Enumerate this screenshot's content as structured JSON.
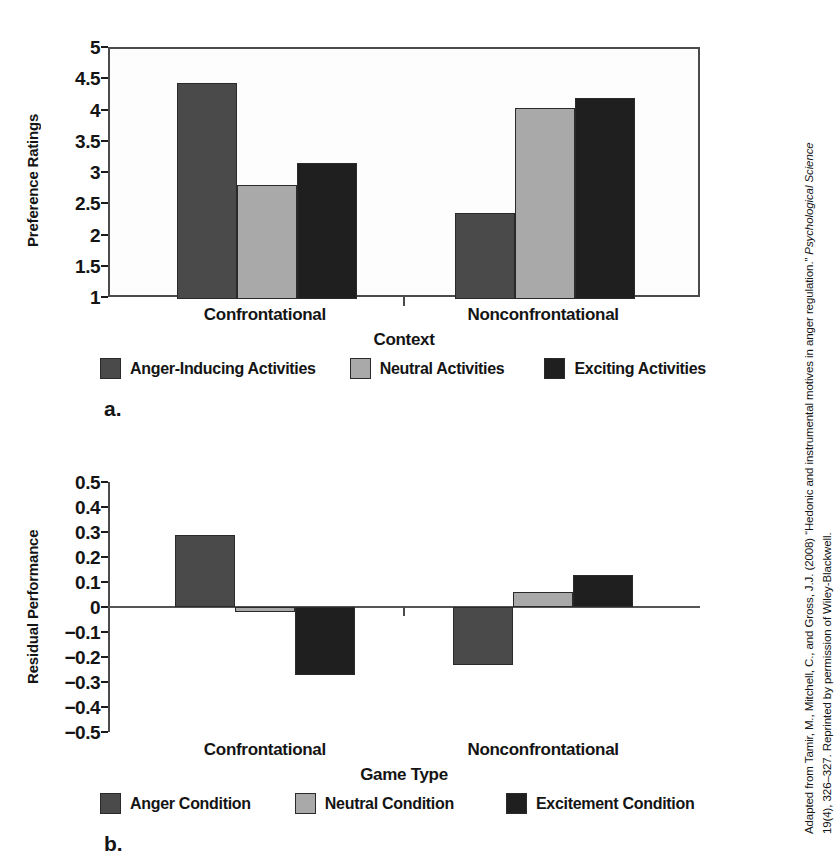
{
  "figure": {
    "panel_a_letter": "a.",
    "panel_b_letter": "b."
  },
  "credit": {
    "line1_pre": "Adapted from Tamir, M., Mitchell, C., and Gross, J.J. (2008) “Hedonic and instrumental motives in anger regulation.” ",
    "line1_italic": "Psychological Science",
    "line2": "19(4), 326–327. Reprinted by permission of Wiley-Blackwell."
  },
  "colors": {
    "series1": "#4a4a4a",
    "series2": "#a9a9a9",
    "series3": "#1f1f1f",
    "axis": "#4b4b4b",
    "text": "#141414"
  },
  "chart_data": [
    {
      "type": "bar",
      "panel": "a",
      "title": "",
      "xlabel": "Context",
      "ylabel": "Preference Ratings",
      "categories": [
        "Confrontational",
        "Nonconfrontational"
      ],
      "ylim": [
        1,
        5
      ],
      "yticks": [
        "1",
        "1.5",
        "2",
        "2.5",
        "3",
        "3.5",
        "4",
        "4.5",
        "5"
      ],
      "ytick_values": [
        1,
        1.5,
        2,
        2.5,
        3,
        3.5,
        4,
        4.5,
        5
      ],
      "grid": false,
      "legend_position": "bottom",
      "series": [
        {
          "name": "Anger-Inducing Activities",
          "color": "#4a4a4a",
          "values": [
            4.46,
            2.37
          ]
        },
        {
          "name": "Neutral Activities",
          "color": "#a9a9a9",
          "values": [
            2.83,
            4.06
          ]
        },
        {
          "name": "Exciting Activities",
          "color": "#1f1f1f",
          "values": [
            3.17,
            4.22
          ]
        }
      ]
    },
    {
      "type": "bar",
      "panel": "b",
      "title": "",
      "xlabel": "Game Type",
      "ylabel": "Residual Performance",
      "categories": [
        "Confrontational",
        "Nonconfrontational"
      ],
      "ylim": [
        -0.5,
        0.5
      ],
      "yticks": [
        "0.5",
        "0.4",
        "0.3",
        "0.2",
        "0.1",
        "0",
        "−0.1",
        "−0.2",
        "−0.3",
        "−0.4",
        "−0.5"
      ],
      "ytick_values": [
        0.5,
        0.4,
        0.3,
        0.2,
        0.1,
        0,
        -0.1,
        -0.2,
        -0.3,
        -0.4,
        -0.5
      ],
      "grid": false,
      "legend_position": "bottom",
      "series": [
        {
          "name": "Anger Condition",
          "color": "#4a4a4a",
          "values": [
            0.29,
            -0.23
          ]
        },
        {
          "name": "Neutral Condition",
          "color": "#a9a9a9",
          "values": [
            -0.02,
            0.06
          ]
        },
        {
          "name": "Excitement Condition",
          "color": "#1f1f1f",
          "values": [
            -0.27,
            0.13
          ]
        }
      ]
    }
  ]
}
